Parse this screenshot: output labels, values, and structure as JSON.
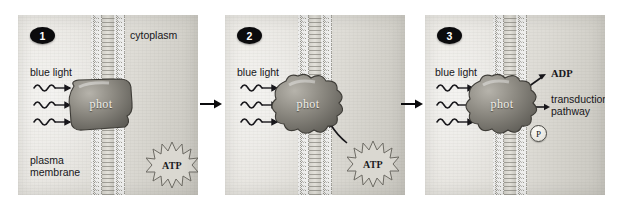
{
  "figure": {
    "background_color": "#ffffff",
    "panel_background": "#e2e0db",
    "badge_color": "#0b0b0d"
  },
  "panels": [
    {
      "number": "1",
      "labels": {
        "cytoplasm": "cytoplasm",
        "blue_light": "blue light",
        "plasma_membrane": "plasma\nmembrane",
        "protein": "phot",
        "molecule": "ATP"
      },
      "state": "inactive",
      "light_rays": 3
    },
    {
      "number": "2",
      "labels": {
        "blue_light": "blue light",
        "protein": "phot",
        "molecule": "ATP"
      },
      "state": "activated",
      "light_rays": 3
    },
    {
      "number": "3",
      "labels": {
        "blue_light": "blue light",
        "protein": "phot",
        "product": "ADP",
        "pathway": "transduction\npathway",
        "phosphate": "P"
      },
      "state": "phosphorylated",
      "light_rays": 3
    }
  ],
  "connectors": {
    "arrow_1_to_2": "→",
    "arrow_2_to_3": "→"
  }
}
